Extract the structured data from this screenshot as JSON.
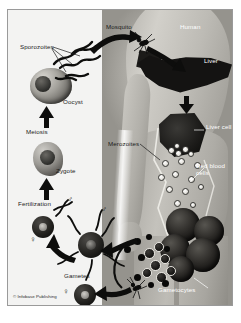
{
  "figure": {
    "credit": "© Infobase Publishing"
  },
  "labels": {
    "sporozoites": "Sporozoites",
    "oocyst": "Oocyst",
    "meiosis": "Meiosis",
    "zygote": "Zygote",
    "fertilization": "Fertilization",
    "gametes": "Gametes",
    "mosquito": "Mosquito",
    "human": "Human",
    "liver": "Liver",
    "liver_cell": "Liver cell",
    "merozoites": "Merozoites",
    "red_blood_cells": "Red blood cells",
    "gametocytes": "Gametocytes"
  },
  "symbols": {
    "male": "♂",
    "female": "♀"
  },
  "colors": {
    "ink": "#111111",
    "paper": "#f3f3f2",
    "frame": "#9a9a9a",
    "human": "#b4b2ac",
    "organ_dark": "#141312",
    "merozoite": "#ffffff"
  }
}
